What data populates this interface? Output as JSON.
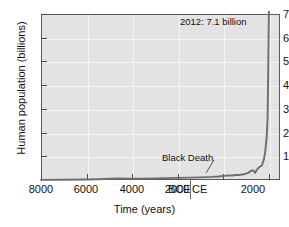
{
  "chart_data": {
    "type": "line",
    "title": "",
    "xlabel": "Time (years)",
    "ylabel": "Human population (billions)",
    "xlim": [
      -8000,
      2500
    ],
    "ylim": [
      0,
      7
    ],
    "grid": true,
    "legend": "none",
    "y_ticks": [
      1,
      2,
      3,
      4,
      5,
      6,
      7
    ],
    "y_tick_labels": [
      "1",
      "2",
      "3",
      "4",
      "5",
      "6",
      "7"
    ],
    "x_ticks": [
      -8000,
      -6000,
      -4000,
      -2000,
      0,
      2000
    ],
    "x_tick_labels": [
      "8000",
      "6000",
      "4000",
      "2000",
      "BCE|CE",
      "2000"
    ],
    "era_labels": {
      "before": "BCE",
      "after": "CE"
    },
    "annotations": [
      {
        "id": "peak",
        "text": "2012: 7.1 billion",
        "x": 2012,
        "y": 7.1
      },
      {
        "id": "black-death",
        "text": "Black Death",
        "x": 1350,
        "y": 0.37
      }
    ],
    "series": [
      {
        "name": "Human population",
        "color": "#6e6e6e",
        "x": [
          -8000,
          -7000,
          -6000,
          -5500,
          -5000,
          -4600,
          -4200,
          -4000,
          -3500,
          -3000,
          -2500,
          -2000,
          -1500,
          -1000,
          -500,
          -200,
          0,
          200,
          400,
          541,
          700,
          900,
          1100,
          1250,
          1300,
          1347,
          1400,
          1500,
          1600,
          1700,
          1800,
          1850,
          1900,
          1927,
          1950,
          1960,
          1974,
          1987,
          1999,
          2011,
          2012
        ],
        "y": [
          0.005,
          0.01,
          0.02,
          0.03,
          0.05,
          0.07,
          0.06,
          0.055,
          0.06,
          0.07,
          0.08,
          0.09,
          0.1,
          0.11,
          0.13,
          0.15,
          0.17,
          0.19,
          0.19,
          0.21,
          0.21,
          0.24,
          0.3,
          0.4,
          0.4,
          0.39,
          0.3,
          0.45,
          0.55,
          0.6,
          0.9,
          1.2,
          1.65,
          2.0,
          2.5,
          3.0,
          4.0,
          5.0,
          6.0,
          7.0,
          7.1
        ]
      }
    ]
  },
  "axes": {
    "y_title": "Human population (billions)",
    "x_title": "Time (years)"
  }
}
